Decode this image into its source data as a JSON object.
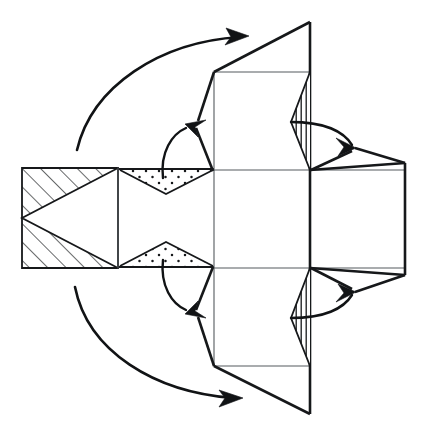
{
  "figure": {
    "type": "diagram",
    "diagram_kind": "unfolded-net-with-fold-arrows",
    "canvas": {
      "width": 426,
      "height": 437,
      "background": "#ffffff"
    },
    "colors": {
      "thin_edge": "#555a5e",
      "thick_edge": "#16181a",
      "arrow": "#111315",
      "face": "#ffffff",
      "hatch": "#16181a",
      "stipple": "#16181a"
    },
    "axes": {
      "center_y": 218,
      "center_x": 262
    }
  },
  "panels": [
    {
      "name": "left-hatched-panel",
      "shape": "rectangle",
      "x1": 22,
      "y1": 168,
      "x2": 118,
      "y2": 268,
      "fill_pattern": "diagonal-hatch",
      "inner_cutout": "left-pointing-triangle"
    },
    {
      "name": "left-stippled-panel",
      "shape": "rectangle",
      "x1": 118,
      "y1": 168,
      "x2": 214,
      "y2": 268,
      "fill_pattern": "stipple-triangles",
      "note": "two dotted triangles, one from top edge pointing down, one from bottom edge pointing up"
    },
    {
      "name": "center-top-panel",
      "shape": "square",
      "x1": 214,
      "y1": 72,
      "x2": 310,
      "y2": 170
    },
    {
      "name": "center-middle-panel",
      "shape": "square",
      "x1": 214,
      "y1": 170,
      "x2": 310,
      "y2": 268
    },
    {
      "name": "center-bottom-panel",
      "shape": "square",
      "x1": 214,
      "y1": 268,
      "x2": 310,
      "y2": 366
    },
    {
      "name": "right-panel",
      "shape": "hexagonal-panel",
      "x1": 310,
      "y1": 170,
      "x2": 405,
      "y2": 268,
      "note": "right edge bevelled at top-right and bottom-right corners"
    }
  ],
  "flaps": [
    {
      "name": "top-flap",
      "shape": "triangle",
      "points": "310,22 310,72 214,72",
      "direction": "up"
    },
    {
      "name": "bottom-flap",
      "shape": "triangle",
      "points": "310,414 310,366 214,366",
      "direction": "down"
    },
    {
      "name": "upper-vertical-hatch-flap",
      "shape": "triangle",
      "points": "310,72 310,170 291,122",
      "fill_pattern": "vertical-hatch"
    },
    {
      "name": "lower-vertical-hatch-flap",
      "shape": "triangle",
      "points": "310,268 310,366 291,318",
      "fill_pattern": "vertical-hatch"
    },
    {
      "name": "left-hatch-cut-upper",
      "shape": "triangle",
      "fill_pattern": "diagonal-hatch"
    },
    {
      "name": "left-hatch-cut-lower",
      "shape": "triangle",
      "fill_pattern": "diagonal-hatch"
    }
  ],
  "arrows": [
    {
      "name": "upper-long-fold-arrow",
      "kind": "curved",
      "from": [
        77,
        150
      ],
      "to": [
        247,
        36
      ],
      "direction": "clockwise-up-right",
      "weight": "thick"
    },
    {
      "name": "lower-long-fold-arrow",
      "kind": "curved",
      "from": [
        75,
        287
      ],
      "to": [
        240,
        398
      ],
      "direction": "counterclockwise-down-right",
      "weight": "thick"
    },
    {
      "name": "upper-short-fold-arrow",
      "kind": "curved",
      "from": [
        165,
        176
      ],
      "to": [
        190,
        126
      ],
      "direction": "up",
      "weight": "medium"
    },
    {
      "name": "lower-short-fold-arrow",
      "kind": "curved",
      "from": [
        165,
        262
      ],
      "to": [
        190,
        312
      ],
      "direction": "down",
      "weight": "medium"
    },
    {
      "name": "upper-right-fold-arrow",
      "kind": "curved",
      "from": [
        304,
        122
      ],
      "to": [
        352,
        147
      ],
      "direction": "right-down",
      "weight": "medium"
    },
    {
      "name": "lower-right-fold-arrow",
      "kind": "curved",
      "from": [
        304,
        318
      ],
      "to": [
        352,
        292
      ],
      "direction": "right-up",
      "weight": "medium"
    }
  ],
  "fold_lines": [
    {
      "name": "fold-left-vertical",
      "x1": 118,
      "y1": 168,
      "x2": 118,
      "y2": 268
    },
    {
      "name": "fold-center-left-vertical",
      "x1": 214,
      "y1": 72,
      "x2": 214,
      "y2": 366
    },
    {
      "name": "fold-center-right-vertical",
      "x1": 310,
      "y1": 22,
      "x2": 310,
      "y2": 414
    },
    {
      "name": "fold-upper-horizontal",
      "x1": 214,
      "y1": 170,
      "x2": 405,
      "y2": 170
    },
    {
      "name": "fold-lower-horizontal",
      "x1": 214,
      "y1": 268,
      "x2": 405,
      "y2": 268
    },
    {
      "name": "fold-top-horizontal",
      "x1": 214,
      "y1": 72,
      "x2": 310,
      "y2": 72
    },
    {
      "name": "fold-bottom-horizontal",
      "x1": 214,
      "y1": 366,
      "x2": 310,
      "y2": 366
    }
  ]
}
